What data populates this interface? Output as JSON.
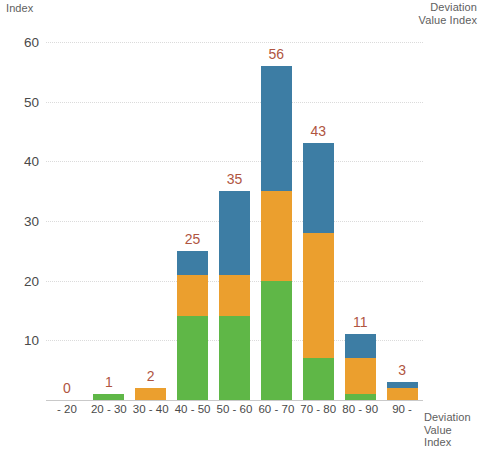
{
  "chart_data": {
    "type": "bar",
    "stacked": true,
    "title": "",
    "subtitle": "",
    "ylabel": "Index",
    "xlabel": "Deviation\nValue Index",
    "legend_title": "Deviation\nValue Index",
    "legend_position": "top-right",
    "grid": true,
    "ylim": [
      0,
      62
    ],
    "yticks": [
      0,
      10,
      20,
      30,
      40,
      50,
      60
    ],
    "ytick_labels": [
      "",
      "10",
      "20",
      "30",
      "40",
      "50",
      "60"
    ],
    "categories": [
      "- 20",
      "20 - 30",
      "30 - 40",
      "40 - 50",
      "50 - 60",
      "60 - 70",
      "70 - 80",
      "80 - 90",
      "90 -"
    ],
    "totals": [
      0,
      1,
      2,
      25,
      35,
      56,
      43,
      11,
      3
    ],
    "data_labels": [
      "0",
      "1",
      "2",
      "25",
      "35",
      "56",
      "43",
      "11",
      "3"
    ],
    "series": [
      {
        "name": "green-segment",
        "color": "#5fb747",
        "values": [
          0,
          1,
          0,
          14,
          14,
          20,
          7,
          1,
          0
        ]
      },
      {
        "name": "orange-segment",
        "color": "#eb9f2e",
        "values": [
          0,
          0,
          2,
          7,
          7,
          15,
          21,
          6,
          2
        ]
      },
      {
        "name": "blue-segment",
        "color": "#3d7da4",
        "values": [
          0,
          0,
          0,
          4,
          14,
          21,
          15,
          4,
          1
        ]
      }
    ],
    "label_color": "#b0553f",
    "axis_text_color": "#4a4a4a",
    "gridline_color": "#d8d8d8",
    "background": "#ffffff"
  }
}
